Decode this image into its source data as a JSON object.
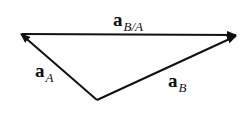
{
  "diagram": {
    "colors": {
      "line": "#111111",
      "background": "#ffffff"
    },
    "points": {
      "left": {
        "x": 20,
        "y": 34
      },
      "right": {
        "x": 237,
        "y": 35
      },
      "bottom": {
        "x": 97,
        "y": 100
      }
    },
    "vectors": [
      {
        "id": "a_BA",
        "from": "left",
        "to": "right",
        "label_main": "a",
        "label_sub": "B/A"
      },
      {
        "id": "a_A",
        "from": "bottom",
        "to": "left",
        "label_main": "a",
        "label_sub": "A"
      },
      {
        "id": "a_B",
        "from": "bottom",
        "to": "right",
        "label_main": "a",
        "label_sub": "B"
      }
    ],
    "labels": {
      "a_BA": {
        "main": "a",
        "sub": "B/A"
      },
      "a_A": {
        "main": "a",
        "sub": "A"
      },
      "a_B": {
        "main": "a",
        "sub": "B"
      }
    }
  }
}
